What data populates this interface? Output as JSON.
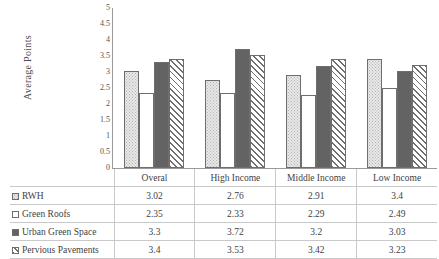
{
  "chart_data": {
    "type": "bar",
    "title": "",
    "subtitle": "",
    "xlabel": "",
    "ylabel": "Average Points",
    "ylim": [
      0,
      5
    ],
    "ytick_labels": [
      "5",
      "4.5",
      "4",
      "3.5",
      "3",
      "2.5",
      "2",
      "1.5",
      "1",
      "0.5",
      "0"
    ],
    "ytick_values": [
      5,
      4.5,
      4,
      3.5,
      3,
      2.5,
      2,
      1.5,
      1,
      0.5,
      0
    ],
    "grid": false,
    "legend_position": "table-below",
    "categories": [
      "Overal",
      "High Income",
      "Middle Income",
      "Low Income"
    ],
    "series": [
      {
        "name": "RWH",
        "pattern": "dotted",
        "values": [
          3.02,
          2.76,
          2.91,
          3.4
        ],
        "value_labels": [
          "3.02",
          "2.76",
          "2.91",
          "3.4"
        ]
      },
      {
        "name": "Green Roofs",
        "pattern": "empty",
        "values": [
          2.35,
          2.33,
          2.29,
          2.49
        ],
        "value_labels": [
          "2.35",
          "2.33",
          "2.29",
          "2.49"
        ]
      },
      {
        "name": "Urban Green Space",
        "pattern": "solid",
        "values": [
          3.3,
          3.72,
          3.2,
          3.03
        ],
        "value_labels": [
          "3.3",
          "3.72",
          "3.2",
          "3.03"
        ]
      },
      {
        "name": "Pervious Pavements",
        "pattern": "hatch",
        "values": [
          3.4,
          3.53,
          3.42,
          3.23
        ],
        "value_labels": [
          "3.4",
          "3.53",
          "3.42",
          "3.23"
        ]
      }
    ]
  },
  "colors": {
    "dotted_fill": "#e8e8e8",
    "empty_fill": "#ffffff",
    "solid_fill": "#636363",
    "hatch_line": "#6f6f6f",
    "bar_border": "#6e6e6e",
    "axis": "#9a9a9a",
    "table_border": "#c9c9c9",
    "text": "#3f3f3f"
  }
}
